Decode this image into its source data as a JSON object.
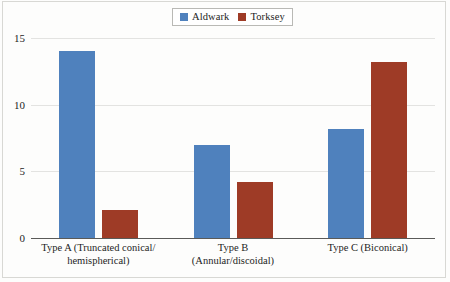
{
  "chart_data": {
    "type": "bar",
    "title": "",
    "subtitle": "",
    "xlabel": "",
    "ylabel": "",
    "ylim": [
      0,
      15
    ],
    "yticks": [
      0,
      5,
      10,
      15
    ],
    "grid": true,
    "legend_position": "top-center",
    "categories": [
      "Type A (Truncated conical/\nhemispherical)",
      "Type B\n(Annular/discoidal)",
      "Type C (Biconical)"
    ],
    "category_lines": [
      [
        "Type A (Truncated conical/",
        "hemispherical)"
      ],
      [
        "Type B",
        "(Annular/discoidal)"
      ],
      [
        "Type C (Biconical)"
      ]
    ],
    "series": [
      {
        "name": "Aldwark",
        "color": "#4f81bd",
        "values": [
          14,
          7,
          8.2
        ]
      },
      {
        "name": "Torksey",
        "color": "#9e3b26",
        "values": [
          2.1,
          4.2,
          13.2
        ]
      }
    ]
  },
  "legend": {
    "entries": [
      {
        "label": "Aldwark",
        "color": "#4f81bd"
      },
      {
        "label": "Torksey",
        "color": "#9e3b26"
      }
    ]
  },
  "axis": {
    "ytick_labels": [
      "0",
      "5",
      "10",
      "15"
    ]
  }
}
